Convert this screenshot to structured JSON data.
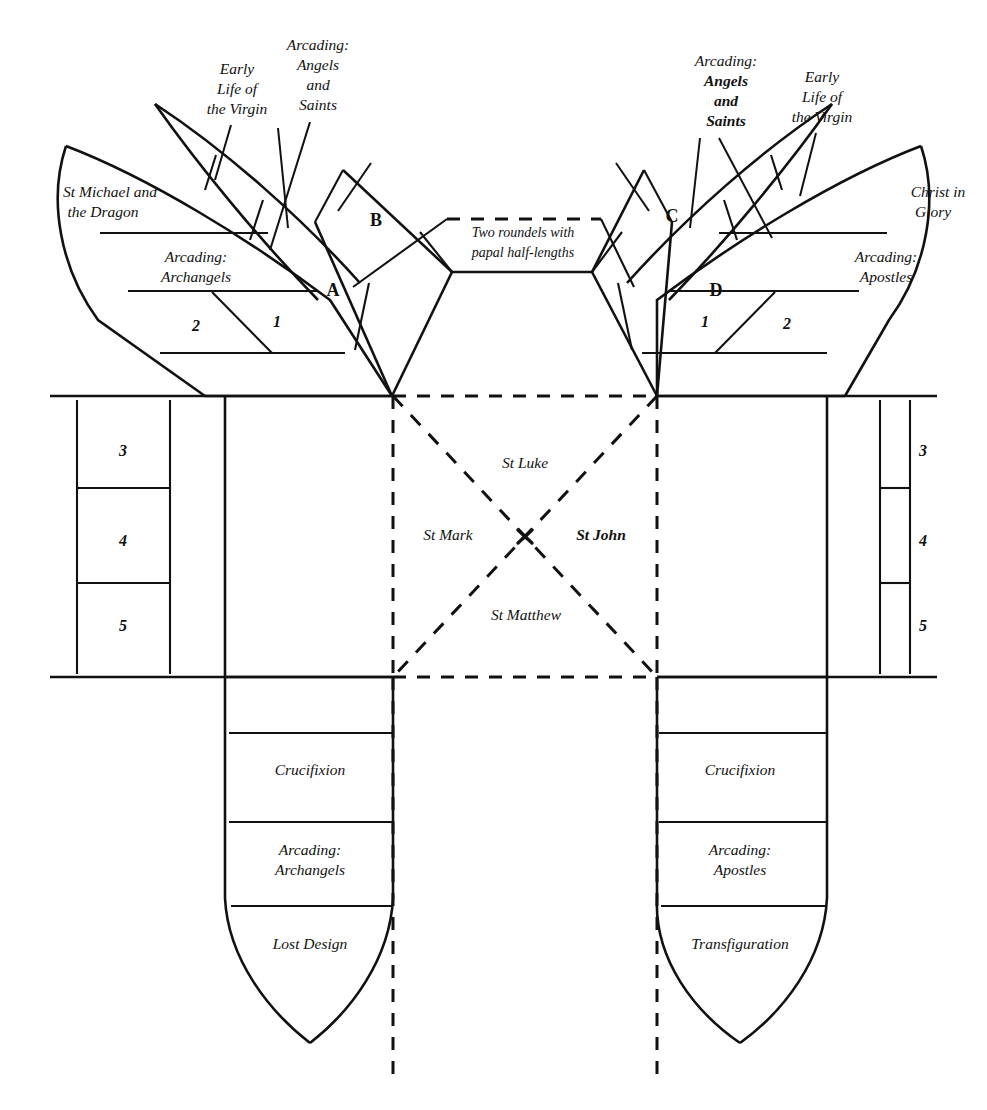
{
  "diagram": {
    "ink_color": "#111111",
    "background_color": "#ffffff"
  },
  "center": {
    "marker": "x",
    "evangelists": {
      "north": "St Luke",
      "west": "St Mark",
      "east": "St John",
      "south": "St Matthew"
    }
  },
  "crossing_note": {
    "line1": "Two roundels with",
    "line2": "papal half-lengths"
  },
  "left_wing": {
    "apse_label_line1": "St Michael and",
    "apse_label_line2": "the Dragon",
    "arcading_line1": "Arcading:",
    "arcading_line2": "Archangels",
    "cell_outer": "2",
    "cell_inner": "1",
    "vault_cell_lower": "A",
    "vault_cell_upper": "B",
    "callout_virgin_line1": "Early",
    "callout_virgin_line2": "Life of",
    "callout_virgin_line3": "the Virgin",
    "callout_arcading_line1": "Arcading:",
    "callout_arcading_line2": "Angels",
    "callout_arcading_line3": "and",
    "callout_arcading_line4": "Saints"
  },
  "right_wing": {
    "apse_label_line1": "Christ in",
    "apse_label_line2": "Glory",
    "arcading_line1": "Arcading:",
    "arcading_line2": "Apostles",
    "cell_inner": "1",
    "cell_outer": "2",
    "vault_cell_upper": "C",
    "vault_cell_lower": "D",
    "callout_arcading_line1": "Arcading:",
    "callout_arcading_line2": "Angels",
    "callout_arcading_line3": "and",
    "callout_arcading_line4": "Saints",
    "callout_virgin_line1": "Early",
    "callout_virgin_line2": "Life of",
    "callout_virgin_line3": "the Virgin"
  },
  "left_wall": {
    "cells": [
      "3",
      "4",
      "5"
    ]
  },
  "right_wall": {
    "cells": [
      "3",
      "4",
      "5"
    ]
  },
  "left_apse": {
    "band1": "Crucifixion",
    "band2_line1": "Arcading:",
    "band2_line2": "Archangels",
    "band3": "Lost Design"
  },
  "right_apse": {
    "band1": "Crucifixion",
    "band2_line1": "Arcading:",
    "band2_line2": "Apostles",
    "band3": "Transfiguration"
  }
}
